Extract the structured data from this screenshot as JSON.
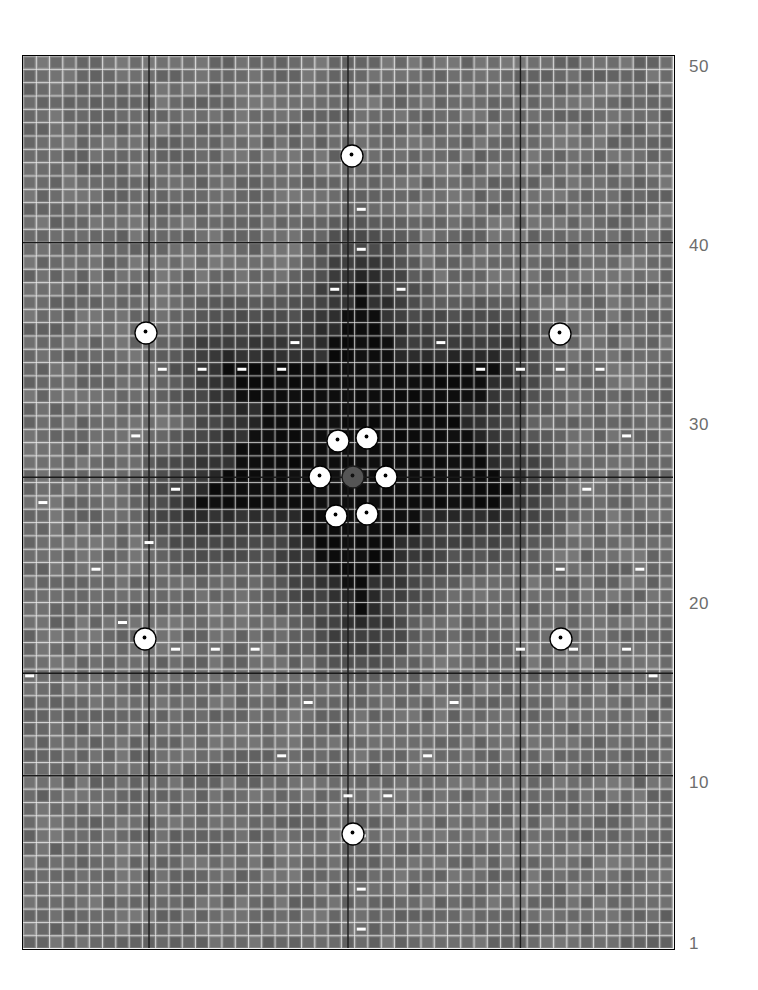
{
  "figure": {
    "title": "",
    "background_color": "#ffffff",
    "plot_border_color": "#000000"
  },
  "axis": {
    "orientation": "right",
    "labels": [
      {
        "text": "50",
        "value": 50,
        "y": 66
      },
      {
        "text": "40",
        "value": 40,
        "y": 245
      },
      {
        "text": "30",
        "value": 30,
        "y": 424
      },
      {
        "text": "20",
        "value": 20,
        "y": 603
      },
      {
        "text": "10",
        "value": 10,
        "y": 782
      },
      {
        "text": "1",
        "value": 1,
        "y": 943
      }
    ],
    "label_color": "#6d6d6d",
    "label_font_size": 17
  },
  "chart_data": {
    "type": "heatmap",
    "title": "",
    "xlabel": "",
    "ylabel": "",
    "grid": true,
    "legend_position": "none",
    "colormap": "grayscale",
    "value_range": [
      0,
      1
    ],
    "cols": 49,
    "rows": 67,
    "cell_px": 13.33,
    "base_value": 0.42,
    "heavy_gridlines": {
      "vertical_cols": [
        9,
        24,
        37
      ],
      "horizontal_rows": [
        14,
        32,
        46,
        54
      ],
      "color": "#1a1a1a"
    },
    "dark_cluster": {
      "description": "Near-black cells forming a vertically elongated diamond with horizontal arms",
      "rows": [
        {
          "row": 17,
          "cols": [
            [
              25,
              25
            ]
          ]
        },
        {
          "row": 18,
          "cols": [
            [
              25,
              25
            ]
          ]
        },
        {
          "row": 19,
          "cols": [
            [
              24,
              26
            ]
          ]
        },
        {
          "row": 20,
          "cols": [
            [
              24,
              26
            ]
          ]
        },
        {
          "row": 21,
          "cols": [
            [
              23,
              27
            ]
          ]
        },
        {
          "row": 22,
          "cols": [
            [
              23,
              27
            ]
          ]
        },
        {
          "row": 23,
          "cols": [
            [
              15,
              35
            ]
          ]
        },
        {
          "row": 24,
          "cols": [
            [
              16,
              34
            ]
          ]
        },
        {
          "row": 25,
          "cols": [
            [
              16,
              34
            ]
          ]
        },
        {
          "row": 26,
          "cols": [
            [
              18,
              32
            ]
          ]
        },
        {
          "row": 27,
          "cols": [
            [
              18,
              32
            ]
          ]
        },
        {
          "row": 28,
          "cols": [
            [
              17,
              33
            ]
          ]
        },
        {
          "row": 29,
          "cols": [
            [
              16,
              34
            ]
          ]
        },
        {
          "row": 30,
          "cols": [
            [
              16,
              34
            ]
          ]
        },
        {
          "row": 31,
          "cols": [
            [
              15,
              35
            ]
          ]
        },
        {
          "row": 32,
          "cols": [
            [
              14,
              36
            ]
          ]
        },
        {
          "row": 33,
          "cols": [
            [
              13,
              35
            ]
          ]
        },
        {
          "row": 34,
          "cols": [
            [
              21,
              29
            ]
          ]
        },
        {
          "row": 35,
          "cols": [
            [
              21,
              29
            ]
          ]
        },
        {
          "row": 36,
          "cols": [
            [
              22,
              27
            ]
          ]
        },
        {
          "row": 37,
          "cols": [
            [
              22,
              27
            ]
          ]
        },
        {
          "row": 38,
          "cols": [
            [
              23,
              26
            ]
          ]
        },
        {
          "row": 39,
          "cols": [
            [
              24,
              25
            ]
          ]
        },
        {
          "row": 40,
          "cols": [
            [
              25,
              25
            ]
          ]
        },
        {
          "row": 41,
          "cols": [
            [
              25,
              25
            ]
          ]
        }
      ]
    },
    "marker_points": {
      "description": "White circular markers with small dark center dot",
      "style": {
        "fill": "#ffffff",
        "edge": "#000000",
        "dot": "#000000",
        "radius_px": 11
      },
      "points": [
        {
          "x_px": 351,
          "y_px": 155
        },
        {
          "x_px": 145,
          "y_px": 332
        },
        {
          "x_px": 559,
          "y_px": 333
        },
        {
          "x_px": 337,
          "y_px": 440
        },
        {
          "x_px": 366,
          "y_px": 437
        },
        {
          "x_px": 319,
          "y_px": 476
        },
        {
          "x_px": 385,
          "y_px": 476
        },
        {
          "x_px": 335,
          "y_px": 515
        },
        {
          "x_px": 366,
          "y_px": 513
        },
        {
          "x_px": 144,
          "y_px": 638
        },
        {
          "x_px": 560,
          "y_px": 638
        },
        {
          "x_px": 352,
          "y_px": 833
        }
      ],
      "center_marker": {
        "x_px": 352,
        "y_px": 476,
        "fill": "#555555",
        "edge": "#1a1a1a",
        "label": "origin-marker"
      }
    },
    "dash_markers": {
      "description": "Small white horizontal bars drawn inside scattered cells",
      "style": {
        "color": "#ffffff",
        "w_px": 9,
        "h_px": 3
      },
      "cells": [
        [
          25,
          11
        ],
        [
          25,
          14
        ],
        [
          23,
          17
        ],
        [
          28,
          17
        ],
        [
          20,
          21
        ],
        [
          31,
          21
        ],
        [
          10,
          23
        ],
        [
          13,
          23
        ],
        [
          16,
          23
        ],
        [
          19,
          23
        ],
        [
          34,
          23
        ],
        [
          37,
          23
        ],
        [
          40,
          23
        ],
        [
          43,
          23
        ],
        [
          8,
          28
        ],
        [
          45,
          28
        ],
        [
          11,
          32
        ],
        [
          42,
          32
        ],
        [
          1,
          33
        ],
        [
          9,
          36
        ],
        [
          5,
          38
        ],
        [
          40,
          38
        ],
        [
          46,
          38
        ],
        [
          7,
          42
        ],
        [
          11,
          44
        ],
        [
          14,
          44
        ],
        [
          17,
          44
        ],
        [
          37,
          44
        ],
        [
          41,
          44
        ],
        [
          45,
          44
        ],
        [
          0,
          46
        ],
        [
          47,
          46
        ],
        [
          21,
          48
        ],
        [
          32,
          48
        ],
        [
          19,
          52
        ],
        [
          30,
          52
        ],
        [
          24,
          55
        ],
        [
          27,
          55
        ],
        [
          25,
          58
        ],
        [
          25,
          62
        ],
        [
          25,
          65
        ]
      ]
    }
  }
}
